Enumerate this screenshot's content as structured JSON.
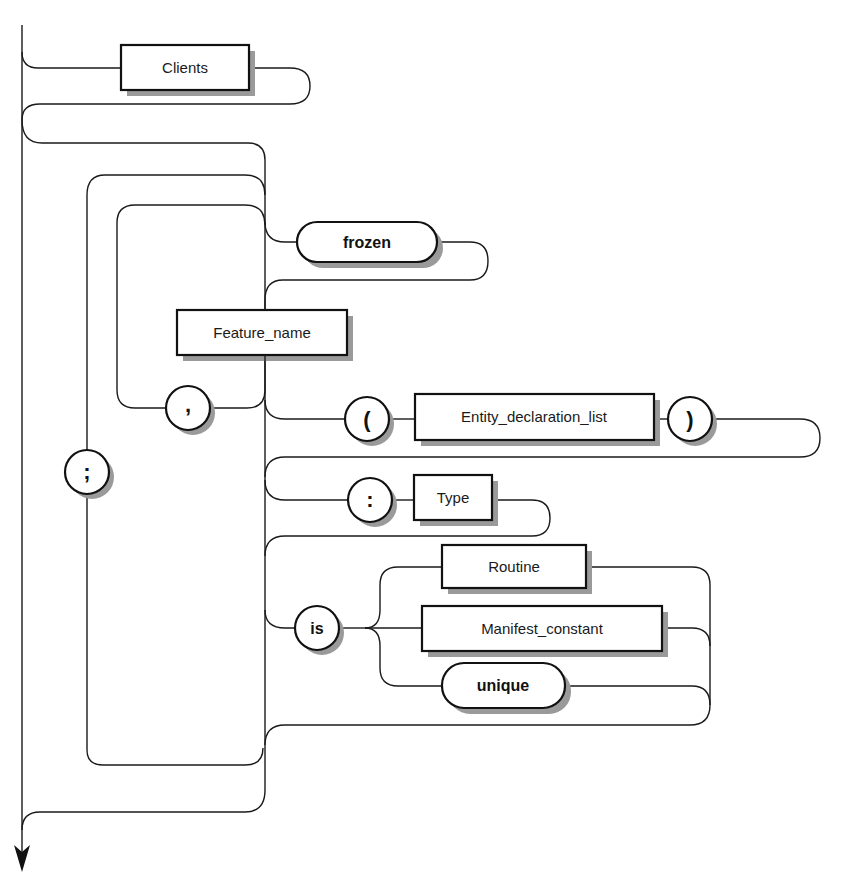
{
  "diagram": {
    "type": "syntax-railroad-diagram",
    "nonterminals": {
      "clients": "Clients",
      "feature_name": "Feature_name",
      "entity_declaration_list": "Entity_declaration_list",
      "type": "Type",
      "routine": "Routine",
      "manifest_constant": "Manifest_constant"
    },
    "keywords": {
      "frozen": "frozen",
      "is": "is",
      "unique": "unique"
    },
    "symbols": {
      "semicolon": ";",
      "comma": ",",
      "open_paren": "(",
      "close_paren": ")",
      "colon": ":"
    },
    "colors": {
      "line": "#1a1a1a",
      "shadow": "#9a9a9a",
      "fill": "#ffffff"
    }
  }
}
